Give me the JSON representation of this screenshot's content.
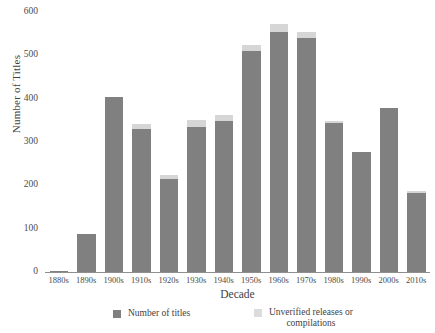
{
  "chart_data": {
    "type": "bar",
    "stacked": true,
    "title": "",
    "xlabel": "Decade",
    "ylabel": "Number of Titles",
    "categories": [
      "1880s",
      "1890s",
      "1900s",
      "1910s",
      "1920s",
      "1930s",
      "1940s",
      "1950s",
      "1960s",
      "1970s",
      "1980s",
      "1990s",
      "2000s",
      "2010s"
    ],
    "series": [
      {
        "name": "Number of titles",
        "color": "#808080",
        "values": [
          2,
          88,
          405,
          330,
          215,
          335,
          348,
          510,
          555,
          540,
          343,
          278,
          378,
          183
        ]
      },
      {
        "name": "Unverified releases or\ncompilations",
        "color": "#d6d6d6",
        "values": [
          0,
          0,
          0,
          12,
          8,
          15,
          15,
          15,
          18,
          15,
          6,
          0,
          0,
          5
        ]
      }
    ],
    "ylim": [
      0,
      600
    ],
    "yticks": [
      0,
      100,
      200,
      300,
      400,
      500,
      600
    ],
    "ytick_labels": [
      "0",
      "100",
      "200",
      "300",
      "400",
      "500",
      "600"
    ],
    "grid": false,
    "legend_position": "bottom"
  },
  "legend": {
    "items": [
      {
        "label": "Number of titles",
        "color": "#808080"
      },
      {
        "label": "Unverified releases or\ncompilations",
        "color": "#dcdcdc"
      }
    ]
  }
}
